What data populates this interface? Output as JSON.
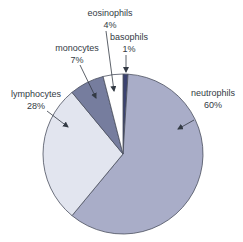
{
  "chart_data": {
    "type": "pie",
    "title": "",
    "categories": [
      "neutrophils",
      "lymphocytes",
      "monocytes",
      "eosinophils",
      "basophils"
    ],
    "values": [
      60,
      28,
      7,
      4,
      1
    ],
    "unit": "%",
    "colors": {
      "neutrophils": "#a9adc8",
      "lymphocytes": "#e2e5ef",
      "monocytes": "#767d9e",
      "eosinophils": "#ffffff",
      "basophils": "#3b4270"
    },
    "labels": [
      {
        "name": "neutrophils",
        "value": "60%"
      },
      {
        "name": "lymphocytes",
        "value": "28%"
      },
      {
        "name": "monocytes",
        "value": "7%"
      },
      {
        "name": "eosinophils",
        "value": "4%"
      },
      {
        "name": "basophils",
        "value": "1%"
      }
    ],
    "legend": "none (callout labels with arrows)",
    "start_angle": "12 o'clock, clockwise beginning with basophils"
  }
}
